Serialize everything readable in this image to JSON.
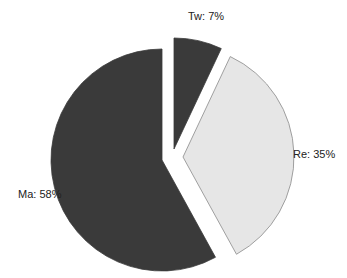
{
  "chart_data": {
    "type": "pie",
    "title": "",
    "start": "top",
    "direction": "clockwise",
    "slices": [
      {
        "label": "Tw",
        "value": 7,
        "display": "Tw: 7%",
        "color": "#3a3a3a",
        "exploded": true
      },
      {
        "label": "Re",
        "value": 35,
        "display": "Re: 35%",
        "color": "#e6e6e6",
        "exploded": true
      },
      {
        "label": "Ma",
        "value": 58,
        "display": "Ma: 58%",
        "color": "#3a3a3a",
        "exploded": false
      }
    ],
    "legend": "none"
  }
}
